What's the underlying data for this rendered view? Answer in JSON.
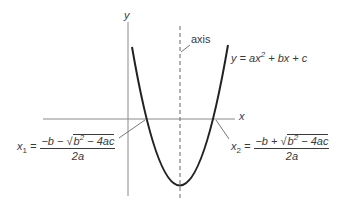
{
  "diagram": {
    "y_axis_label": "y",
    "x_axis_label": "x",
    "axis_label": "axis",
    "equation": {
      "lhs": "y = ax",
      "exp": "2",
      "rhs": " + bx + c"
    },
    "root1": {
      "var": "x",
      "sub": "1",
      "eq": " =",
      "num_prefix": "−b − √",
      "radicand": "b",
      "radicand_exp": "2",
      "radicand_rest": " − 4ac",
      "den": "2a"
    },
    "root2": {
      "var": "x",
      "sub": "2",
      "eq": " =",
      "num_prefix": "−b + √",
      "radicand": "b",
      "radicand_exp": "2",
      "radicand_rest": " − 4ac",
      "den": "2a"
    },
    "colors": {
      "curve": "#222222",
      "axes": "#888888",
      "axis_of_symmetry": "#666666",
      "text": "#3a3a3a"
    }
  }
}
